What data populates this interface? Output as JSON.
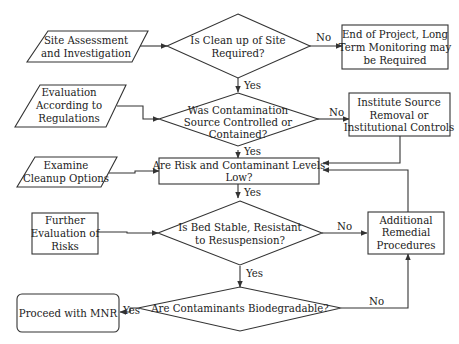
{
  "diagram": {
    "type": "flowchart",
    "nodes": {
      "site_assessment": {
        "shape": "parallelogram",
        "lines": [
          "Site Assessment",
          "and Investigation"
        ]
      },
      "q_cleanup": {
        "shape": "diamond",
        "lines": [
          "Is Clean up of Site",
          "Required?"
        ]
      },
      "end_project": {
        "shape": "rectangle",
        "lines": [
          "End of Project, Long",
          "Term Monitoring may",
          "be Required"
        ]
      },
      "evaluation_regulations": {
        "shape": "parallelogram",
        "lines": [
          "Evaluation",
          "According to",
          "Regulations"
        ]
      },
      "q_source": {
        "shape": "diamond",
        "lines": [
          "Was Contamination",
          "Source Controlled or",
          "Contained?"
        ]
      },
      "institute_source": {
        "shape": "rectangle",
        "lines": [
          "Institute Source",
          "Removal or",
          "Institutional Controls"
        ]
      },
      "examine_cleanup": {
        "shape": "parallelogram",
        "lines": [
          "Examine",
          "Cleanup Options"
        ]
      },
      "q_risk": {
        "shape": "rectangle",
        "lines": [
          "Are Risk and Contaminant Levels",
          "Low?"
        ]
      },
      "further_evaluation": {
        "shape": "rectangle",
        "lines": [
          "Further",
          "Evaluation of",
          "Risks"
        ]
      },
      "q_bed": {
        "shape": "diamond",
        "lines": [
          "Is Bed Stable, Resistant",
          "to Resuspension?"
        ]
      },
      "additional_remedial": {
        "shape": "rectangle",
        "lines": [
          "Additional",
          "Remedial",
          "Procedures"
        ]
      },
      "proceed_mnr": {
        "shape": "rounded-rectangle",
        "lines": [
          "Proceed with MNR"
        ]
      },
      "q_biodegradable": {
        "shape": "diamond",
        "lines": [
          "Are Contaminants Biodegradable?"
        ]
      }
    },
    "edge_labels": {
      "yes": "Yes",
      "no": "No"
    },
    "edges": [
      {
        "from": "site_assessment",
        "to": "q_cleanup",
        "label": ""
      },
      {
        "from": "q_cleanup",
        "to": "end_project",
        "label": "No"
      },
      {
        "from": "q_cleanup",
        "to": "q_source",
        "label": "Yes"
      },
      {
        "from": "evaluation_regulations",
        "to": "q_source",
        "label": ""
      },
      {
        "from": "q_source",
        "to": "institute_source",
        "label": "No"
      },
      {
        "from": "q_source",
        "to": "q_risk",
        "label": "Yes"
      },
      {
        "from": "institute_source",
        "to": "q_risk",
        "label": ""
      },
      {
        "from": "examine_cleanup",
        "to": "q_risk",
        "label": ""
      },
      {
        "from": "q_risk",
        "to": "q_bed",
        "label": "Yes"
      },
      {
        "from": "further_evaluation",
        "to": "q_bed",
        "label": ""
      },
      {
        "from": "q_bed",
        "to": "additional_remedial",
        "label": "No"
      },
      {
        "from": "q_bed",
        "to": "q_biodegradable",
        "label": "Yes"
      },
      {
        "from": "additional_remedial",
        "to": "q_risk",
        "label": ""
      },
      {
        "from": "q_biodegradable",
        "to": "proceed_mnr",
        "label": "Yes"
      },
      {
        "from": "q_biodegradable",
        "to": "additional_remedial",
        "label": "No"
      }
    ]
  }
}
